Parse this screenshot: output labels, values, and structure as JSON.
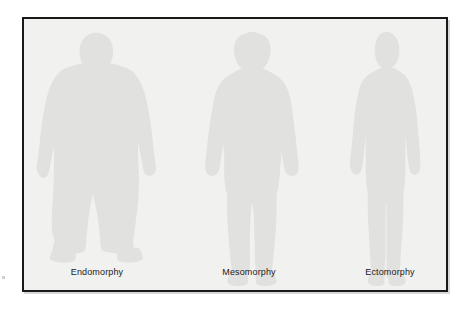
{
  "figure": {
    "kind": "somatotype-diagram",
    "background_color": "#f1f1ef",
    "border_color": "#191919",
    "silhouette_color": "#e1e1df",
    "label_color": "#1b1b1b",
    "page_background": "#ffffff",
    "panels": [
      {
        "id": "endomorphy",
        "label": "Endomorphy",
        "build": "heavy, rounded, wide-hipped",
        "center_x": 73
      },
      {
        "id": "mesomorphy",
        "label": "Mesomorphy",
        "build": "muscular, broad-shouldered, athletic",
        "center_x": 225
      },
      {
        "id": "ectomorphy",
        "label": "Ectomorphy",
        "build": "lean, slender, narrow-framed",
        "center_x": 366
      }
    ]
  }
}
